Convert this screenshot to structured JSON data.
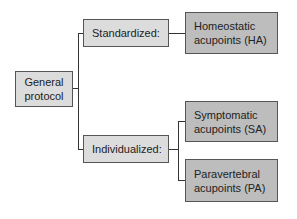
{
  "diagram": {
    "root": {
      "label": "General\nprotocol"
    },
    "branches": [
      {
        "label": "Standardized:",
        "children": [
          {
            "label": "Homeostatic\nacupoints (HA)"
          }
        ]
      },
      {
        "label": "Individualized:",
        "children": [
          {
            "label": "Symptomatic\nacupoints (SA)"
          },
          {
            "label": "Paravertebral\nacupoints (PA)"
          }
        ]
      }
    ]
  },
  "colors": {
    "level1_fill": "#dcdcdc",
    "level2_fill": "#bdbdbd",
    "line": "#333333"
  }
}
